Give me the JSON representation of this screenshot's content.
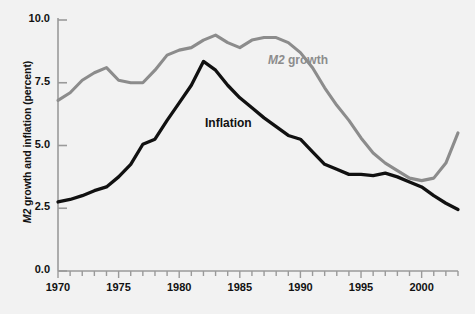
{
  "chart_data": {
    "type": "line",
    "title": "",
    "xlabel": "",
    "ylabel": "M2 growth and inflation (percent)",
    "ylabel_italic_prefix": "M2",
    "ylabel_rest": " growth and inflation (percent)",
    "xlim": [
      1970,
      2003
    ],
    "ylim": [
      0.0,
      10.0
    ],
    "grid": false,
    "legend_position": "inline-annotation",
    "ytick_labels": [
      "0.0",
      "2.5",
      "5.0",
      "7.5",
      "10.0"
    ],
    "ytick_values": [
      0.0,
      2.5,
      5.0,
      7.5,
      10.0
    ],
    "xtick_labels": [
      "1970",
      "1975",
      "1980",
      "1985",
      "1990",
      "1995",
      "2000"
    ],
    "xtick_values": [
      1970,
      1975,
      1980,
      1985,
      1990,
      1995,
      2000
    ],
    "x_minor_tick_interval": 1,
    "x": [
      1970,
      1971,
      1972,
      1973,
      1974,
      1975,
      1976,
      1977,
      1978,
      1979,
      1980,
      1981,
      1982,
      1983,
      1984,
      1985,
      1986,
      1987,
      1988,
      1989,
      1990,
      1991,
      1992,
      1993,
      1994,
      1995,
      1996,
      1997,
      1998,
      1999,
      2000,
      2001,
      2002,
      2003
    ],
    "series": [
      {
        "name": "M2 growth",
        "color": "#8c8c8c",
        "label_x": 2003,
        "values": [
          6.8,
          7.1,
          7.6,
          7.9,
          8.1,
          7.6,
          7.5,
          7.5,
          8.0,
          8.6,
          8.8,
          8.9,
          9.2,
          9.4,
          9.1,
          8.9,
          9.2,
          9.3,
          9.3,
          9.1,
          8.7,
          8.1,
          7.3,
          6.6,
          6.0,
          5.3,
          4.7,
          4.3,
          4.0,
          3.7,
          3.6,
          3.7,
          4.3,
          5.5
        ]
      },
      {
        "name": "Inflation",
        "color": "#111111",
        "label_x": 1986,
        "values": [
          2.75,
          2.85,
          3.0,
          3.2,
          3.35,
          3.75,
          4.25,
          5.05,
          5.25,
          6.0,
          6.7,
          7.4,
          8.35,
          8.0,
          7.4,
          6.9,
          6.5,
          6.1,
          5.75,
          5.4,
          5.25,
          4.75,
          4.25,
          4.05,
          3.85,
          3.85,
          3.8,
          3.9,
          3.75,
          3.55,
          3.35,
          3.0,
          2.7,
          2.45
        ]
      }
    ],
    "annotations": [
      {
        "text": "M2 growth",
        "italic_prefix": "M2",
        "rest": " growth",
        "color": "#8c8c8c",
        "left": 268,
        "top": 53
      },
      {
        "text": "Inflation",
        "italic_prefix": "",
        "rest": "Inflation",
        "color": "#111111",
        "left": 205,
        "top": 116
      }
    ]
  },
  "axes": {
    "axis_color": "#9a9a9a",
    "background": "#f2f2f2"
  }
}
